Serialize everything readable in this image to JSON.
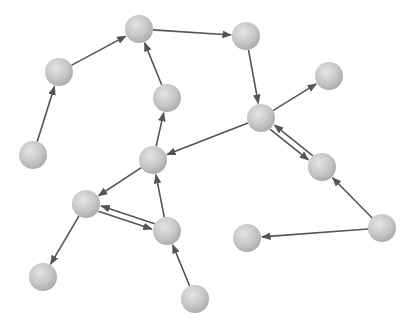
{
  "diagram": {
    "type": "directed-graph",
    "background": "#ffffff",
    "node_color": "#c8c8c8",
    "node_highlight": "#e6e6e6",
    "node_shadow": "#a9a9a9",
    "edge_color": "#555555",
    "node_radius": 14,
    "nodes": [
      {
        "id": "n1",
        "x": 33,
        "y": 155
      },
      {
        "id": "n2",
        "x": 59,
        "y": 72
      },
      {
        "id": "n3",
        "x": 139,
        "y": 29
      },
      {
        "id": "n4",
        "x": 246,
        "y": 36
      },
      {
        "id": "n5",
        "x": 167,
        "y": 98
      },
      {
        "id": "n6",
        "x": 261,
        "y": 118
      },
      {
        "id": "n7",
        "x": 329,
        "y": 76
      },
      {
        "id": "n8",
        "x": 153,
        "y": 160
      },
      {
        "id": "n9",
        "x": 322,
        "y": 167
      },
      {
        "id": "n10",
        "x": 86,
        "y": 204
      },
      {
        "id": "n11",
        "x": 167,
        "y": 231
      },
      {
        "id": "n12",
        "x": 382,
        "y": 228
      },
      {
        "id": "n13",
        "x": 247,
        "y": 238
      },
      {
        "id": "n14",
        "x": 43,
        "y": 277
      },
      {
        "id": "n15",
        "x": 195,
        "y": 299
      }
    ],
    "edges": [
      {
        "from": "n1",
        "to": "n2"
      },
      {
        "from": "n2",
        "to": "n3"
      },
      {
        "from": "n3",
        "to": "n4"
      },
      {
        "from": "n5",
        "to": "n3"
      },
      {
        "from": "n4",
        "to": "n6"
      },
      {
        "from": "n6",
        "to": "n7"
      },
      {
        "from": "n6",
        "to": "n8"
      },
      {
        "from": "n8",
        "to": "n5"
      },
      {
        "from": "n6",
        "to": "n9",
        "offset": 3
      },
      {
        "from": "n9",
        "to": "n6",
        "offset": 3
      },
      {
        "from": "n8",
        "to": "n10"
      },
      {
        "from": "n10",
        "to": "n11",
        "offset": 3
      },
      {
        "from": "n11",
        "to": "n10",
        "offset": 3
      },
      {
        "from": "n11",
        "to": "n8"
      },
      {
        "from": "n12",
        "to": "n9"
      },
      {
        "from": "n12",
        "to": "n13"
      },
      {
        "from": "n10",
        "to": "n14"
      },
      {
        "from": "n15",
        "to": "n11"
      }
    ]
  }
}
